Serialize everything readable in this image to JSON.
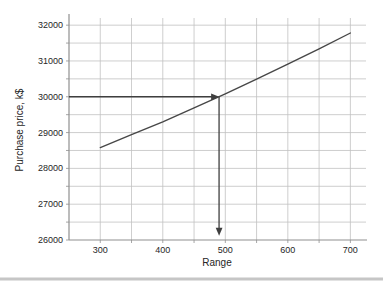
{
  "chart_data": {
    "type": "line",
    "title": "",
    "xlabel": "Range",
    "ylabel": "Purchase price, k$",
    "xlim": [
      250,
      725
    ],
    "ylim": [
      26000,
      32200
    ],
    "x_major_ticks": [
      300,
      400,
      500,
      600,
      700
    ],
    "x_minor_step": 50,
    "y_major_ticks": [
      26000,
      27000,
      28000,
      29000,
      30000,
      31000,
      32000
    ],
    "y_minor_step": 500,
    "grid": true,
    "legend": "none",
    "series": [
      {
        "name": "purchase-price-vs-range",
        "x": [
          300,
          350,
          400,
          450,
          500,
          550,
          600,
          650,
          700
        ],
        "y": [
          28580,
          28940,
          29300,
          29690,
          30080,
          30490,
          30910,
          31340,
          31780
        ]
      }
    ],
    "annotations": [
      {
        "type": "arrow",
        "name": "horizontal-guide-arrow",
        "from": [
          250,
          30000
        ],
        "to": [
          490,
          30000
        ],
        "meaning": "price level 30000 k$"
      },
      {
        "type": "arrow",
        "name": "vertical-guide-arrow",
        "from": [
          490,
          30000
        ],
        "to": [
          490,
          26120
        ],
        "meaning": "range readout ~490"
      }
    ],
    "colors": {
      "grid": "#c2c2c2",
      "axis": "#8f8f8f",
      "curve": "#474747",
      "arrow": "#3f3f3f",
      "text": "#262626",
      "background": "#ffffff",
      "bottom_band": "#c6c6c6"
    }
  }
}
